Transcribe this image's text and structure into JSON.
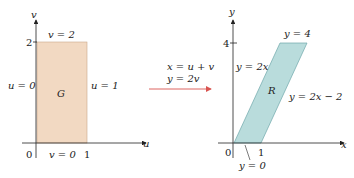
{
  "left_plot": {
    "region_label": "G",
    "axis_h_label": "u",
    "axis_v_label": "v",
    "origin": "0",
    "tick_u": "1",
    "tick_v": "2",
    "top_edge": "v = 2",
    "bottom_edge": "v = 0",
    "left_edge": "u = 0",
    "right_edge": "u = 1",
    "fill_color": "#f2d9c2"
  },
  "transform": {
    "line1": "x = u + v",
    "line2": "y = 2v",
    "arrow_color": "#d9534f"
  },
  "right_plot": {
    "region_label": "R",
    "axis_h_label": "x",
    "axis_v_label": "y",
    "origin": "0",
    "tick_x": "1",
    "tick_y": "4",
    "top_edge": "y = 4",
    "bottom_edge": "y = 0",
    "left_edge": "y = 2x",
    "right_edge": "y = 2x − 2",
    "fill_color": "#b9dcdc"
  }
}
